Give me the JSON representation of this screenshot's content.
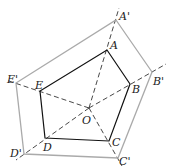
{
  "diagram": {
    "center": {
      "label": "O",
      "x": 89,
      "y": 108
    },
    "inner": [
      {
        "label": "A",
        "x": 107,
        "y": 50
      },
      {
        "label": "B",
        "x": 130,
        "y": 84
      },
      {
        "label": "C",
        "x": 109,
        "y": 141
      },
      {
        "label": "D",
        "x": 45,
        "y": 138
      },
      {
        "label": "E",
        "x": 40,
        "y": 91
      }
    ],
    "outer": [
      {
        "label": "A'",
        "x": 116,
        "y": 20
      },
      {
        "label": "B'",
        "x": 152,
        "y": 72
      },
      {
        "label": "C'",
        "x": 118,
        "y": 158
      },
      {
        "label": "D'",
        "x": 24,
        "y": 154
      },
      {
        "label": "E'",
        "x": 16,
        "y": 83
      }
    ],
    "colors": {
      "inner": "#111111",
      "outer": "#aaaaaa",
      "dashed": "#333333"
    }
  }
}
